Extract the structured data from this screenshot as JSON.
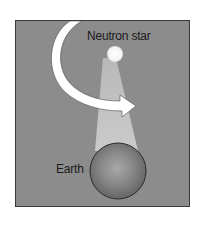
{
  "diagram": {
    "labels": {
      "neutron_star": "Neutron star",
      "earth": "Earth"
    },
    "colors": {
      "background": "#8c8c8c",
      "beam": "#c9c9c9",
      "star": "#ffffff",
      "arrow": "#ffffff",
      "earth": "#6f6f6f",
      "frame_border": "#3a3a3a"
    },
    "elements": [
      {
        "name": "neutron-star",
        "shape": "circle"
      },
      {
        "name": "emission-beam",
        "shape": "cone",
        "direction": "toward Earth"
      },
      {
        "name": "rotation-arrow",
        "shape": "curved arrow",
        "direction": "clockwise"
      },
      {
        "name": "earth",
        "shape": "sphere"
      }
    ]
  }
}
